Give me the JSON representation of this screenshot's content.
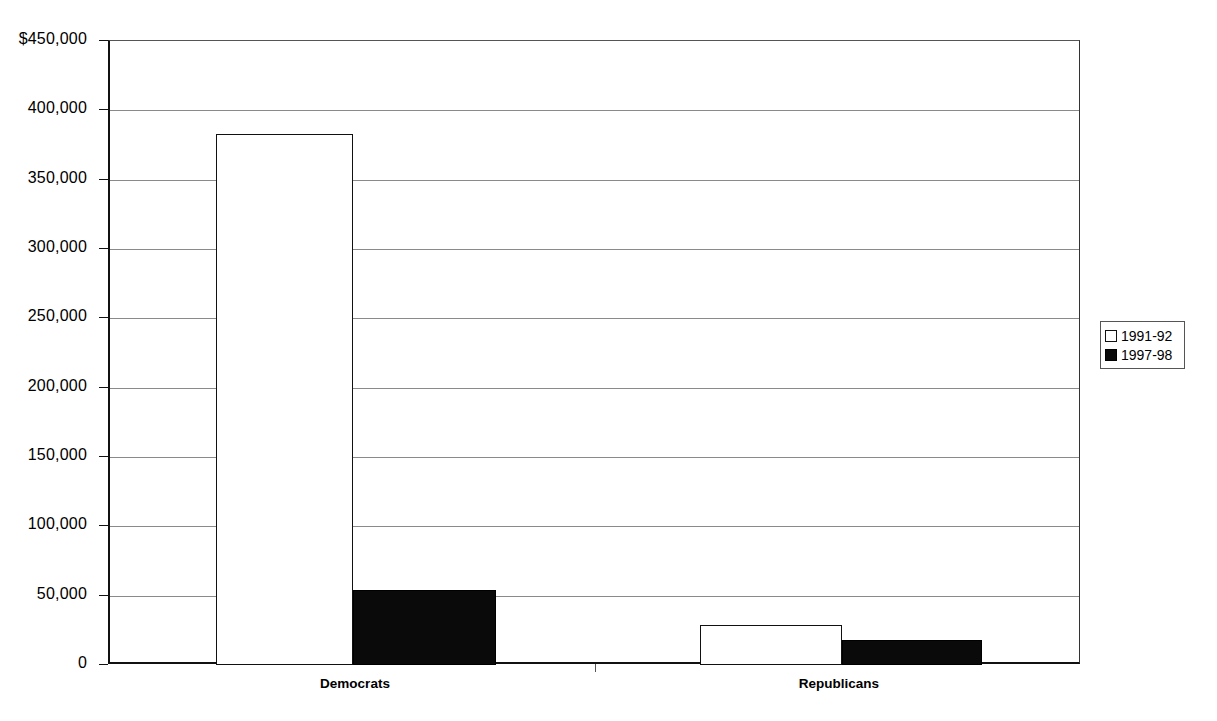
{
  "chart_data": {
    "type": "bar",
    "title": "",
    "subtitle": "",
    "xlabel": "",
    "ylabel": "",
    "categories": [
      "Democrats",
      "Republicans"
    ],
    "series": [
      {
        "name": "1991-92",
        "values": [
          383000,
          29000
        ],
        "fill": "#ffffff",
        "stroke": "#111111"
      },
      {
        "name": "1997-98",
        "values": [
          54000,
          18000
        ],
        "fill": "#0a0a0a",
        "stroke": "#000000"
      }
    ],
    "ylim": [
      0,
      450000
    ],
    "y_ticks": [
      0,
      50000,
      100000,
      150000,
      200000,
      250000,
      300000,
      350000,
      400000,
      450000
    ],
    "y_tick_labels": [
      "0",
      "50,000",
      "100,000",
      "150,000",
      "200,000",
      "250,000",
      "300,000",
      "350,000",
      "400,000",
      "$450,000"
    ],
    "grid": true,
    "grid_axis": "y",
    "legend_position": "right",
    "annotations": []
  },
  "legend": {
    "entries": [
      {
        "label": "1991-92",
        "swatch": "open-square-icon"
      },
      {
        "label": "1997-98",
        "swatch": "filled-square-icon"
      }
    ]
  },
  "axes": {
    "x_categories": [
      "Democrats",
      "Republicans"
    ],
    "y_labels": [
      "$450,000",
      "400,000",
      "350,000",
      "300,000",
      "250,000",
      "200,000",
      "150,000",
      "100,000",
      "50,000",
      "0"
    ]
  }
}
